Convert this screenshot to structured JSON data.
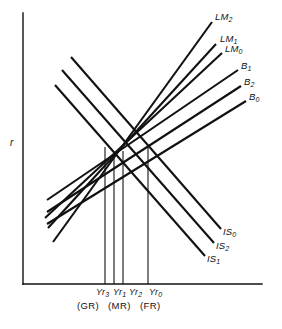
{
  "figure": {
    "type": "IS-LM-B macroeconomic equilibrium diagram",
    "background_color": "#ffffff",
    "line_color": "#111111"
  },
  "axes": {
    "y_axis_label": "r",
    "x_axis_label": "",
    "origin": {
      "x": 23,
      "y": 284
    },
    "y_top": 13,
    "x_right": 262,
    "grid": false
  },
  "chart_data": {
    "type": "line",
    "title": "",
    "xlabel": "",
    "ylabel": "r",
    "grid": false,
    "legend": "inline-end-labels",
    "xlim": [
      23,
      262
    ],
    "ylim": [
      284,
      13
    ],
    "series": [
      {
        "name": "LM2",
        "label": "LM",
        "subscript": "2",
        "slope": "upward",
        "x1": 53,
        "y1": 242,
        "x2": 212,
        "y2": 22
      },
      {
        "name": "LM1",
        "label": "LM",
        "subscript": "1",
        "slope": "upward",
        "x1": 48,
        "y1": 228,
        "x2": 216,
        "y2": 44
      },
      {
        "name": "LM0",
        "label": "LM",
        "subscript": "0",
        "slope": "upward",
        "x1": 45,
        "y1": 218,
        "x2": 222,
        "y2": 53
      },
      {
        "name": "B1",
        "label": "B",
        "subscript": "1",
        "slope": "upward",
        "x1": 47,
        "y1": 200,
        "x2": 238,
        "y2": 70
      },
      {
        "name": "B2",
        "label": "B",
        "subscript": "2",
        "slope": "upward",
        "x1": 47,
        "y1": 212,
        "x2": 241,
        "y2": 86
      },
      {
        "name": "B0",
        "label": "B",
        "subscript": "0",
        "slope": "upward",
        "x1": 47,
        "y1": 224,
        "x2": 246,
        "y2": 101
      },
      {
        "name": "IS0",
        "label": "IS",
        "subscript": "0",
        "slope": "downward",
        "x1": 71,
        "y1": 57,
        "x2": 221,
        "y2": 229
      },
      {
        "name": "IS2",
        "label": "IS",
        "subscript": "2",
        "slope": "downward",
        "x1": 62,
        "y1": 70,
        "x2": 214,
        "y2": 243
      },
      {
        "name": "IS1",
        "label": "IS",
        "subscript": "1",
        "slope": "downward",
        "x1": 55,
        "y1": 85,
        "x2": 205,
        "y2": 256
      }
    ],
    "curve_labels": [
      {
        "id": "LM2",
        "text": "LM",
        "sub": "2",
        "x": 215,
        "y": 12
      },
      {
        "id": "LM1",
        "text": "LM",
        "sub": "1",
        "x": 220,
        "y": 34
      },
      {
        "id": "LM0",
        "text": "LM",
        "sub": "0",
        "x": 225,
        "y": 44
      },
      {
        "id": "B1",
        "text": "B",
        "sub": "1",
        "x": 241,
        "y": 61
      },
      {
        "id": "B2",
        "text": "B",
        "sub": "2",
        "x": 244,
        "y": 77
      },
      {
        "id": "B0",
        "text": "B",
        "sub": "0",
        "x": 249,
        "y": 92
      },
      {
        "id": "IS0",
        "text": "IS",
        "sub": "0",
        "x": 223,
        "y": 227
      },
      {
        "id": "IS2",
        "text": "IS",
        "sub": "2",
        "x": 216,
        "y": 241
      },
      {
        "id": "IS1",
        "text": "IS",
        "sub": "1",
        "x": 207,
        "y": 254
      }
    ],
    "equilibrium_verticals": [
      {
        "id": "Yr3",
        "x": 105,
        "y_top": 147,
        "y_bottom": 284
      },
      {
        "id": "Yr1",
        "x": 114,
        "y_top": 155,
        "y_bottom": 284
      },
      {
        "id": "Yr2",
        "x": 123,
        "y_top": 151,
        "y_bottom": 284
      },
      {
        "id": "Yr0",
        "x": 148,
        "y_top": 147,
        "y_bottom": 284
      }
    ],
    "x_tick_labels": [
      {
        "text": "Yr",
        "sub": "3",
        "x": 96,
        "y": 288
      },
      {
        "text": "Yr",
        "sub": "1",
        "x": 113,
        "y": 288
      },
      {
        "text": "Yr",
        "sub": "2",
        "x": 129,
        "y": 288
      },
      {
        "text": "Yr",
        "sub": "0",
        "x": 149,
        "y": 288
      }
    ],
    "regime_labels": [
      {
        "text": "(GR)",
        "x": 77,
        "y": 301
      },
      {
        "text": "(MR)",
        "x": 108,
        "y": 301
      },
      {
        "text": "(FR)",
        "x": 140,
        "y": 301
      }
    ]
  }
}
